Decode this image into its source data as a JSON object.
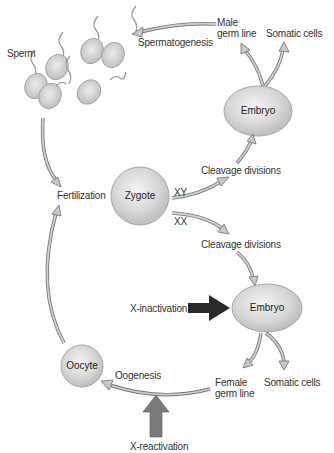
{
  "diagram": {
    "nodes": {
      "sperm": "Sperm",
      "spermatogenesis": "Spermatogenesis",
      "male_germ_line_1": "Male",
      "male_germ_line_2": "germ line",
      "somatic_cells_top": "Somatic cells",
      "embryo_top": "Embryo",
      "cleavage_top": "Cleavage divisions",
      "xy": "XY",
      "xx": "XX",
      "fertilization": "Fertilization",
      "zygote": "Zygote",
      "cleavage_bottom": "Cleavage divisions",
      "x_inactivation": "X-inactivation",
      "embryo_bottom": "Embryo",
      "oocyte": "Oocyte",
      "oogenesis": "Oogenesis",
      "female_germ_line_1": "Female",
      "female_germ_line_2": "germ line",
      "somatic_cells_bottom": "Somatic cells",
      "x_reactivation": "X-reactivation"
    },
    "colors": {
      "cell_fill": "#d6d6d6",
      "cell_stroke": "#a8a8a8",
      "arrow_fill": "#c8c8c8",
      "arrow_stroke": "#777777",
      "x_inactivation_arrow": "#2a2a2a",
      "x_reactivation_arrow": "#7a7a7a"
    }
  }
}
